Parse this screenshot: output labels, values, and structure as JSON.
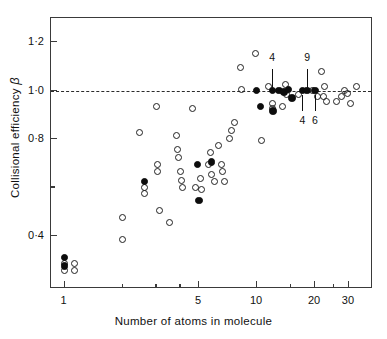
{
  "chart_data": {
    "type": "scatter",
    "title": "",
    "xlabel": "Number of atoms in molecule",
    "ylabel": "Collisional efficiency",
    "ylabel_symbol": "β",
    "xscale": "log",
    "yscale": "linear",
    "xlim": [
      0.85,
      40
    ],
    "ylim": [
      0.18,
      1.3
    ],
    "grid": false,
    "legend": null,
    "xticks": [
      {
        "value": 1,
        "label": "1",
        "major": true
      },
      {
        "value": 2,
        "label": "",
        "major": false
      },
      {
        "value": 3,
        "label": "",
        "major": false
      },
      {
        "value": 4,
        "label": "",
        "major": false
      },
      {
        "value": 5,
        "label": "5",
        "major": true
      },
      {
        "value": 10,
        "label": "10",
        "major": true
      },
      {
        "value": 15,
        "label": "",
        "major": false
      },
      {
        "value": 20,
        "label": "20",
        "major": true
      },
      {
        "value": 25,
        "label": "",
        "major": false
      },
      {
        "value": 30,
        "label": "30",
        "major": true
      }
    ],
    "yticks": [
      {
        "value": 1.2,
        "label": "1·2",
        "major": true
      },
      {
        "value": 1.0,
        "label": "1·0",
        "major": true
      },
      {
        "value": 0.8,
        "label": "0·8",
        "major": true
      },
      {
        "value": 0.6,
        "label": "",
        "major": false
      },
      {
        "value": 0.4,
        "label": "0·4",
        "major": true
      }
    ],
    "reference_lines": [
      {
        "axis": "y",
        "value": 1.0,
        "style": "dashed",
        "color": "#2b2b2b"
      }
    ],
    "series": [
      {
        "name": "open",
        "marker": "open-circle",
        "color": "#202020",
        "points": [
          [
            1,
            0.285
          ],
          [
            1,
            0.255
          ],
          [
            1.12,
            0.285
          ],
          [
            1.12,
            0.255
          ],
          [
            2,
            0.385
          ],
          [
            2,
            0.475
          ],
          [
            2.45,
            0.825
          ],
          [
            2.6,
            0.6
          ],
          [
            2.6,
            0.575
          ],
          [
            3,
            0.935
          ],
          [
            3.05,
            0.695
          ],
          [
            3.05,
            0.665
          ],
          [
            3.1,
            0.505
          ],
          [
            3.5,
            0.455
          ],
          [
            3.8,
            0.815
          ],
          [
            3.85,
            0.755
          ],
          [
            3.9,
            0.725
          ],
          [
            4.0,
            0.665
          ],
          [
            4.05,
            0.63
          ],
          [
            4.1,
            0.6
          ],
          [
            4.6,
            0.925
          ],
          [
            4.8,
            0.6
          ],
          [
            5.1,
            0.635
          ],
          [
            5.15,
            0.59
          ],
          [
            5.6,
            0.695
          ],
          [
            5.7,
            0.745
          ],
          [
            5.8,
            0.655
          ],
          [
            6.0,
            0.625
          ],
          [
            6.3,
            0.775
          ],
          [
            6.5,
            0.695
          ],
          [
            6.6,
            0.665
          ],
          [
            6.8,
            0.625
          ],
          [
            7.2,
            0.8
          ],
          [
            7.4,
            0.835
          ],
          [
            7.6,
            0.87
          ],
          [
            8.2,
            1.095
          ],
          [
            8.3,
            1.005
          ],
          [
            9.8,
            1.155
          ],
          [
            10.5,
            0.795
          ],
          [
            11.5,
            1.015
          ],
          [
            12.0,
            0.945
          ],
          [
            12.0,
            0.925
          ],
          [
            13.5,
            0.935
          ],
          [
            14.0,
            1.025
          ],
          [
            14.2,
            0.985
          ],
          [
            16.5,
            0.985
          ],
          [
            19.5,
            1.0
          ],
          [
            20.5,
            0.975
          ],
          [
            21.5,
            1.08
          ],
          [
            22.0,
            0.975
          ],
          [
            22.5,
            1.015
          ],
          [
            23.0,
            0.955
          ],
          [
            26.0,
            0.955
          ],
          [
            27.5,
            0.975
          ],
          [
            28.5,
            1.0
          ],
          [
            29.5,
            0.99
          ],
          [
            30.5,
            0.945
          ],
          [
            33.0,
            1.015
          ]
        ]
      },
      {
        "name": "filled",
        "marker": "filled-circle",
        "color": "#0d0d0d",
        "points": [
          [
            1,
            0.31
          ],
          [
            1,
            0.275
          ],
          [
            2.6,
            0.625
          ],
          [
            4.9,
            0.695
          ],
          [
            5.0,
            0.545
          ],
          [
            5.8,
            0.705
          ],
          [
            9.9,
            1.0
          ],
          [
            10.4,
            0.935
          ],
          [
            12.0,
            1.0
          ],
          [
            12.1,
            0.915
          ],
          [
            13.0,
            1.0
          ],
          [
            13.8,
            0.995
          ],
          [
            14.6,
            1.005
          ],
          [
            15.2,
            0.97
          ],
          [
            17.2,
            1.0
          ],
          [
            18.2,
            1.0
          ],
          [
            20.0,
            1.0
          ]
        ]
      }
    ],
    "annotations": [
      {
        "text": "4",
        "x": 12.0,
        "y": 1.135,
        "anchor_x": 12.0,
        "anchor_y": 1.0,
        "position": "above"
      },
      {
        "text": "9",
        "x": 18.2,
        "y": 1.135,
        "anchor_x": 18.2,
        "anchor_y": 1.0,
        "position": "above"
      },
      {
        "text": "4",
        "x": 17.2,
        "y": 0.875,
        "anchor_x": 17.2,
        "anchor_y": 1.0,
        "position": "below"
      },
      {
        "text": "6",
        "x": 20.0,
        "y": 0.875,
        "anchor_x": 20.0,
        "anchor_y": 1.0,
        "position": "below"
      }
    ]
  }
}
